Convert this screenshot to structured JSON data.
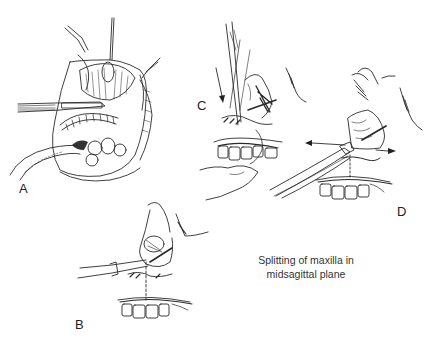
{
  "figure": {
    "panels": [
      {
        "id": "A",
        "label": "A"
      },
      {
        "id": "B",
        "label": "B"
      },
      {
        "id": "C",
        "label": "C"
      },
      {
        "id": "D",
        "label": "D"
      }
    ],
    "caption": {
      "line1": "Splitting of maxilla in",
      "line2": "midsagittal plane"
    },
    "colors": {
      "ink": "#222222",
      "background": "#ffffff"
    }
  }
}
